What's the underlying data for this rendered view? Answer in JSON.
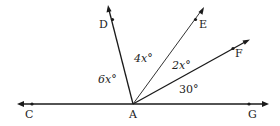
{
  "diagram": {
    "type": "geometry-angles",
    "vertex": {
      "name": "A",
      "label": "A"
    },
    "points": [
      {
        "name": "C",
        "label": "C"
      },
      {
        "name": "D",
        "label": "D"
      },
      {
        "name": "E",
        "label": "E"
      },
      {
        "name": "F",
        "label": "F"
      },
      {
        "name": "G",
        "label": "G"
      }
    ],
    "rays": [
      {
        "from": "A",
        "through": "C",
        "arrow": true
      },
      {
        "from": "A",
        "through": "G",
        "arrow": true
      },
      {
        "from": "A",
        "through": "D",
        "arrow": true
      },
      {
        "from": "A",
        "through": "E",
        "arrow": true
      },
      {
        "from": "A",
        "through": "F",
        "arrow": true
      }
    ],
    "angles": [
      {
        "between": [
          "C",
          "D"
        ],
        "label": "6x°"
      },
      {
        "between": [
          "D",
          "E"
        ],
        "label": "4x°"
      },
      {
        "between": [
          "E",
          "F"
        ],
        "label": "2x°"
      },
      {
        "between": [
          "F",
          "G"
        ],
        "label": "30°"
      }
    ],
    "colors": {
      "line": "#1a1a1a",
      "text": "#222222",
      "background": "#ffffff"
    }
  }
}
